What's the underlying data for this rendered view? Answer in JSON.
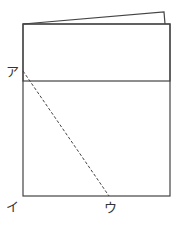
{
  "diagram": {
    "labels": {
      "a": "ア",
      "i": "イ",
      "u": "ウ"
    },
    "colors": {
      "stroke": "#444444",
      "background": "#ffffff"
    }
  }
}
